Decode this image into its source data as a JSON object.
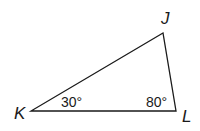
{
  "figure": {
    "type": "triangle",
    "vertices": [
      {
        "name": "J",
        "x": 163,
        "y": 33,
        "label_x": 161,
        "label_y": 24
      },
      {
        "name": "K",
        "x": 31,
        "y": 111,
        "label_x": 14,
        "label_y": 119
      },
      {
        "name": "L",
        "x": 176,
        "y": 111,
        "label_x": 182,
        "label_y": 122
      }
    ],
    "angles": [
      {
        "vertex": "K",
        "text": "30°",
        "x": 61,
        "y": 107
      },
      {
        "vertex": "L",
        "text": "80°",
        "x": 146,
        "y": 107
      }
    ],
    "stroke_color": "#1a1a1a"
  }
}
